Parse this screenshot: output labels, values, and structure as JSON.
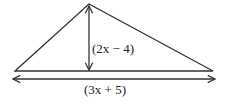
{
  "diagram": {
    "type": "triangle",
    "height_label": "(2x − 4)",
    "base_label": "(3x + 5)",
    "stroke_color": "#333333",
    "background": "#ffffff"
  }
}
